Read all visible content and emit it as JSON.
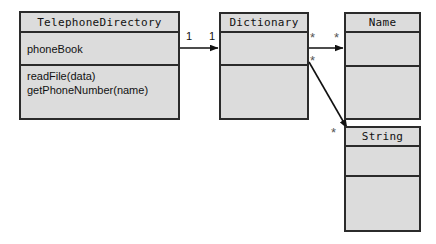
{
  "diagram": {
    "type": "uml-class-diagram",
    "classes": [
      {
        "id": "telephone-directory",
        "name": "TelephoneDirectory",
        "attributes": [
          "phoneBook"
        ],
        "operations": [
          "readFile(data)",
          "getPhoneNumber(name)"
        ]
      },
      {
        "id": "dictionary",
        "name": "Dictionary",
        "attributes": [],
        "operations": []
      },
      {
        "id": "name",
        "name": "Name",
        "attributes": [],
        "operations": []
      },
      {
        "id": "string",
        "name": "String",
        "attributes": [],
        "operations": []
      }
    ],
    "associations": [
      {
        "id": "telephonedirectory-to-dictionary",
        "from": "telephone-directory",
        "to": "dictionary",
        "source_multiplicity": "1",
        "target_multiplicity": "1"
      },
      {
        "id": "dictionary-to-name",
        "from": "dictionary",
        "to": "name",
        "source_multiplicity": "*",
        "target_multiplicity": "*"
      },
      {
        "id": "dictionary-to-string",
        "from": "dictionary",
        "to": "string",
        "source_multiplicity": "*",
        "target_multiplicity": "*"
      }
    ],
    "colors": {
      "class_fill": "#dcdcdc",
      "class_border": "#2b2b2b",
      "edge": "#111111",
      "background": "#ffffff",
      "text": "#111111"
    }
  }
}
